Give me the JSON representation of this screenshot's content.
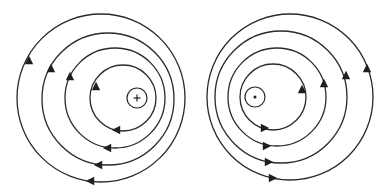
{
  "figure": {
    "description": "Magnetic field lines around two current-carrying wires",
    "stroke_color": "#2a2a2a",
    "background": "#ffffff"
  },
  "panels": [
    {
      "id": "left",
      "wire": {
        "cx": 137,
        "cy": 98,
        "r": 10,
        "symbol": "cross",
        "meaning": "current into page"
      },
      "field_lines": [
        {
          "cx": 123,
          "cy": 98,
          "r": 33
        },
        {
          "cx": 115,
          "cy": 98,
          "r": 50
        },
        {
          "cx": 108,
          "cy": 99,
          "r": 66
        },
        {
          "cx": 101,
          "cy": 98,
          "r": 84
        }
      ],
      "arrows": [
        {
          "x": 96,
          "y": 86,
          "dir": "up"
        },
        {
          "x": 70,
          "y": 76,
          "dir": "up"
        },
        {
          "x": 51,
          "y": 68,
          "dir": "up"
        },
        {
          "x": 29,
          "y": 60,
          "dir": "up"
        },
        {
          "x": 116,
          "y": 130,
          "dir": "left"
        },
        {
          "x": 107,
          "y": 148,
          "dir": "left"
        },
        {
          "x": 98,
          "y": 165,
          "dir": "left"
        },
        {
          "x": 90,
          "y": 181,
          "dir": "left"
        }
      ]
    },
    {
      "id": "right",
      "wire": {
        "cx": 255,
        "cy": 97,
        "r": 10,
        "symbol": "dot",
        "meaning": "current out of page"
      },
      "field_lines": [
        {
          "cx": 273,
          "cy": 97,
          "r": 33
        },
        {
          "cx": 277,
          "cy": 97,
          "r": 49
        },
        {
          "cx": 281,
          "cy": 97,
          "r": 66
        },
        {
          "cx": 290,
          "cy": 97,
          "r": 83
        }
      ],
      "arrows": [
        {
          "x": 302,
          "y": 89,
          "dir": "up"
        },
        {
          "x": 324,
          "y": 83,
          "dir": "up"
        },
        {
          "x": 346,
          "y": 75,
          "dir": "up"
        },
        {
          "x": 367,
          "y": 68,
          "dir": "up"
        },
        {
          "x": 265,
          "y": 128,
          "dir": "right"
        },
        {
          "x": 267,
          "y": 146,
          "dir": "right"
        },
        {
          "x": 269,
          "y": 162,
          "dir": "right"
        },
        {
          "x": 273,
          "y": 178,
          "dir": "right"
        }
      ]
    }
  ]
}
